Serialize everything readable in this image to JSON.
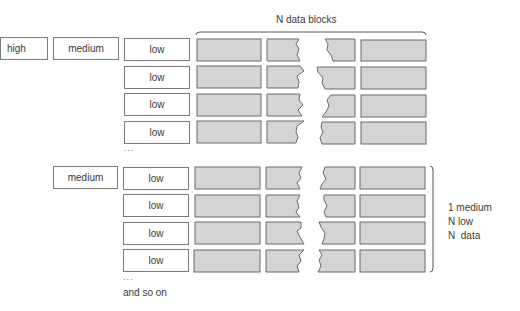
{
  "title": "N data blocks",
  "top_group": {
    "high_label": "high",
    "medium_label": "medium",
    "low_labels": [
      "low",
      "low",
      "low",
      "low"
    ],
    "ellipsis": "..."
  },
  "bottom_group": {
    "medium_label": "medium",
    "low_labels": [
      "low",
      "low",
      "low",
      "low"
    ],
    "ellipsis": "..."
  },
  "footer": "and so on",
  "bracket_note": {
    "lines": [
      "1 medium",
      "N low",
      "N  data"
    ]
  },
  "colors": {
    "block_fill": "#d4d4d4",
    "block_stroke": "#6a6a6a",
    "box_stroke": "#7a7a7a"
  }
}
